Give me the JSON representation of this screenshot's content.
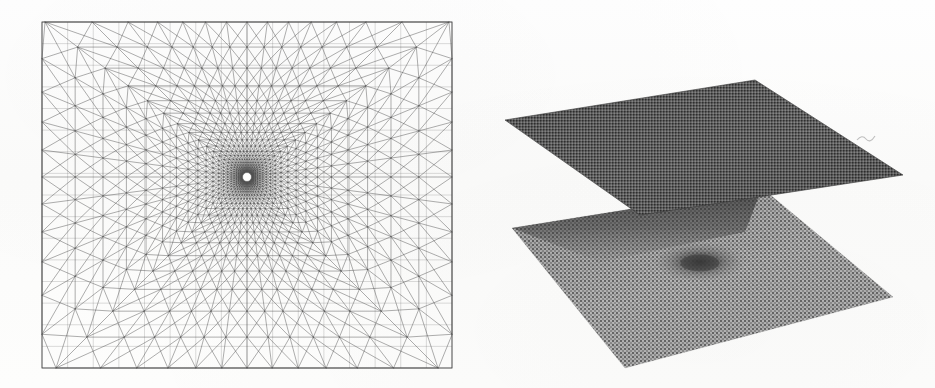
{
  "figure": {
    "kind": "scientific-figure-scan",
    "background_color": "#fdfdfc",
    "ink_color": "#3a3a3a",
    "width": 935,
    "height": 388,
    "panel_count": 2,
    "panels": [
      {
        "id": "left",
        "name": "graded-triangular-mesh",
        "type": "mesh-plot",
        "projection": "2d-plan",
        "description": "Square domain discretized by a criss-cross triangular finite element mesh, radially graded with strong refinement toward a point singularity at the domain centre.",
        "bounds": {
          "x": 42,
          "y": 22,
          "width": 410,
          "height": 346
        },
        "center": {
          "x": 247,
          "y": 177
        },
        "rings": 26,
        "sectors": 48,
        "refinement_ratio": 0.84,
        "element_type": "triangle",
        "line_color": "#4a4a4a",
        "line_width": 0.45
      },
      {
        "id": "right",
        "name": "two-surface-axonometric-plot",
        "type": "surface-plot",
        "projection": "axonometric",
        "description": "Two stacked quadrilateral surface patches rendered in axonometric projection. The upper patch is a uniformly dark shaded plane; the lower patch is a lighter halftone-textured mesh surface with a dark dimple marking the singular point.",
        "surfaces": [
          {
            "name": "upper-surface",
            "label": "upper-plane",
            "fill": "#6a6a6a",
            "texture": "halftone-dense",
            "corners": {
              "left": {
                "x": 505,
                "y": 120
              },
              "top": {
                "x": 755,
                "y": 80
              },
              "right": {
                "x": 903,
                "y": 175
              },
              "bottom": {
                "x": 640,
                "y": 215
              }
            }
          },
          {
            "name": "lower-surface",
            "label": "lower-mesh-plane",
            "fill": "#9a9a9a",
            "texture": "halftone-mesh",
            "corners": {
              "left": {
                "x": 512,
                "y": 228
              },
              "top": {
                "x": 762,
                "y": 188
              },
              "right": {
                "x": 893,
                "y": 297
              },
              "bottom": {
                "x": 625,
                "y": 368
              }
            },
            "feature": {
              "name": "central-dimple",
              "x": 700,
              "y": 262,
              "radius_x": 46,
              "radius_y": 20,
              "depth_shade": "#3e3e3e"
            }
          }
        ],
        "artifact": {
          "name": "scan-speck",
          "x": 866,
          "y": 136
        }
      }
    ]
  }
}
